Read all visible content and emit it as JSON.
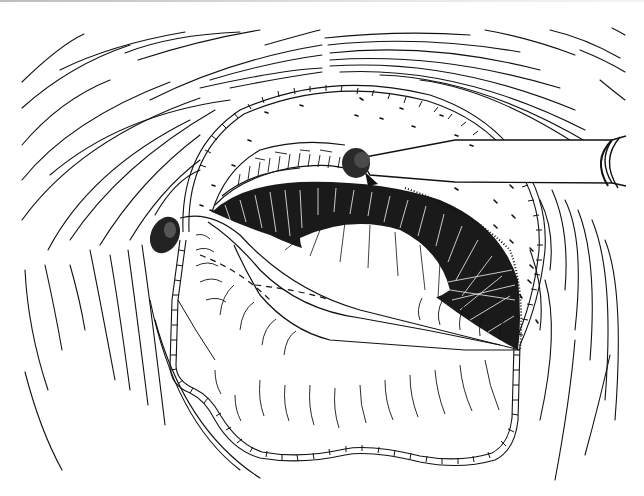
{
  "figure": {
    "kind": "surgical line illustration",
    "colors": {
      "background": "#ffffff",
      "ink": "#111111",
      "top_band": "#bdbdbd"
    },
    "elements": [
      "concentric-arcs",
      "capsule-edge-ring",
      "instrument",
      "instrument-tip-stipple",
      "left-stipple-blob",
      "hatched-lens-region",
      "folded-flap",
      "dot-marks"
    ]
  }
}
